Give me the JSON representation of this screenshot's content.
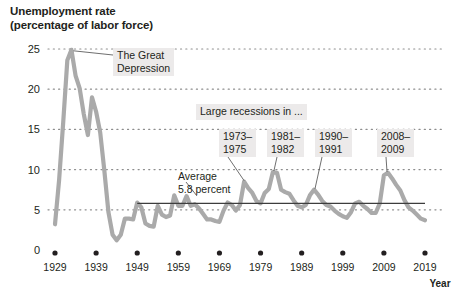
{
  "title": {
    "line1": "Unemployment rate",
    "line2": "(percentage of labor force)"
  },
  "axes": {
    "x_axis_name": "Year",
    "y_ticks": [
      "0",
      "5",
      "10",
      "15",
      "20",
      "25"
    ],
    "x_ticks": [
      "1929",
      "1939",
      "1949",
      "1959",
      "1969",
      "1979",
      "1989",
      "1999",
      "2009",
      "2019"
    ]
  },
  "annotations": {
    "great_depression": {
      "line1": "The Great",
      "line2": "Depression"
    },
    "large_recessions_header": "Large recessions in ...",
    "average": {
      "line1": "Average",
      "line2": "5.8 percent"
    },
    "recessions": [
      {
        "line1": "1973–",
        "line2": "1975"
      },
      {
        "line1": "1981–",
        "line2": "1982"
      },
      {
        "line1": "1990–",
        "line2": "1991"
      },
      {
        "line1": "2008–",
        "line2": "2009"
      }
    ]
  },
  "colors": {
    "line": "#aaaaaa",
    "grid": "#8d8d8d",
    "text": "#231f20",
    "callout_bg": "#eceaea",
    "average_line": "#3d3d3d"
  },
  "chart_data": {
    "type": "line",
    "title": "Unemployment rate (percentage of labor force)",
    "xlabel": "Year",
    "ylabel": "percentage of labor force",
    "xlim": [
      1929,
      2019
    ],
    "ylim": [
      0,
      26
    ],
    "grid": true,
    "grid_style": "dotted-horizontal",
    "legend": "none",
    "average_value": 5.8,
    "series": [
      {
        "name": "Unemployment rate",
        "x": [
          1929,
          1930,
          1931,
          1932,
          1933,
          1934,
          1935,
          1936,
          1937,
          1938,
          1939,
          1940,
          1941,
          1942,
          1943,
          1944,
          1945,
          1946,
          1947,
          1948,
          1949,
          1950,
          1951,
          1952,
          1953,
          1954,
          1955,
          1956,
          1957,
          1958,
          1959,
          1960,
          1961,
          1962,
          1963,
          1964,
          1965,
          1966,
          1967,
          1968,
          1969,
          1970,
          1971,
          1972,
          1973,
          1974,
          1975,
          1976,
          1977,
          1978,
          1979,
          1980,
          1981,
          1982,
          1983,
          1984,
          1985,
          1986,
          1987,
          1988,
          1989,
          1990,
          1991,
          1992,
          1993,
          1994,
          1995,
          1996,
          1997,
          1998,
          1999,
          2000,
          2001,
          2002,
          2003,
          2004,
          2005,
          2006,
          2007,
          2008,
          2009,
          2010,
          2011,
          2012,
          2013,
          2014,
          2015,
          2016,
          2017,
          2018,
          2019
        ],
        "values": [
          3.2,
          8.7,
          15.9,
          23.6,
          24.9,
          21.7,
          20.1,
          16.9,
          14.3,
          19.0,
          17.2,
          14.6,
          9.9,
          4.7,
          1.9,
          1.2,
          1.9,
          3.9,
          3.9,
          3.8,
          5.9,
          5.3,
          3.3,
          3.0,
          2.9,
          5.5,
          4.4,
          4.1,
          4.3,
          6.8,
          5.5,
          5.5,
          6.7,
          5.5,
          5.7,
          5.2,
          4.5,
          3.8,
          3.8,
          3.6,
          3.5,
          4.9,
          5.9,
          5.6,
          4.9,
          5.6,
          8.5,
          7.7,
          7.1,
          6.1,
          5.8,
          7.1,
          7.6,
          9.7,
          9.6,
          7.5,
          7.2,
          7.0,
          6.2,
          5.5,
          5.3,
          5.6,
          6.8,
          7.5,
          6.9,
          6.1,
          5.6,
          5.4,
          4.9,
          4.5,
          4.2,
          4.0,
          4.7,
          5.8,
          6.0,
          5.5,
          5.1,
          4.6,
          4.6,
          5.8,
          9.3,
          9.6,
          8.9,
          8.1,
          7.4,
          6.2,
          5.3,
          4.9,
          4.4,
          3.9,
          3.7
        ],
        "color": "#aaaaaa"
      }
    ],
    "annotated_peaks": [
      {
        "label": "The Great Depression",
        "year": 1933,
        "value": 24.9
      },
      {
        "label": "1973-1975",
        "year": 1975,
        "value": 8.5
      },
      {
        "label": "1981-1982",
        "year": 1982,
        "value": 9.7
      },
      {
        "label": "1990-1991",
        "year": 1992,
        "value": 7.5
      },
      {
        "label": "2008-2009",
        "year": 2010,
        "value": 9.6
      }
    ]
  }
}
